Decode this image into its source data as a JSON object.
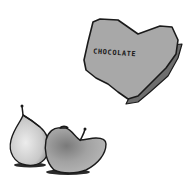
{
  "illustration": {
    "chocolate_box": {
      "shape": "heart",
      "label": "CHOCOLATE",
      "fill_color": "#a8a8a8",
      "outline_color": "#1a1a1a",
      "side_color": "#6e6e6e"
    },
    "pear": {
      "fill_color": "#d6d6d6",
      "shade_color": "#9a9a9a",
      "outline_color": "#1a1a1a"
    },
    "apple": {
      "fill_color": "#9c9c9c",
      "shade_color": "#6a6a6a",
      "outline_color": "#1a1a1a"
    },
    "background_color": "#ffffff"
  }
}
